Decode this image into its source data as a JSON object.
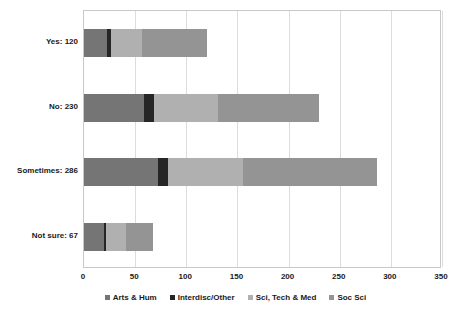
{
  "chart_data": {
    "type": "bar",
    "orientation": "horizontal",
    "stacked": true,
    "title": "",
    "xlabel": "",
    "ylabel": "",
    "xlim": [
      0,
      350
    ],
    "xticks": [
      0,
      50,
      100,
      150,
      200,
      250,
      300,
      350
    ],
    "grid": true,
    "legend_position": "bottom",
    "categories": [
      "Yes: 120",
      "No: 230",
      "Sometimes: 286",
      "Not sure: 67"
    ],
    "category_totals": [
      120,
      230,
      286,
      67
    ],
    "series": [
      {
        "name": "Arts & Hum",
        "color": "#757575",
        "values": [
          22,
          59,
          72,
          20
        ]
      },
      {
        "name": "Interdisc/Other",
        "color": "#262626",
        "values": [
          4,
          9,
          10,
          2
        ]
      },
      {
        "name": "Sci, Tech & Med",
        "color": "#b0b0b0",
        "values": [
          31,
          63,
          73,
          19
        ]
      },
      {
        "name": "Soc Sci",
        "color": "#949494",
        "values": [
          63,
          99,
          131,
          26
        ]
      }
    ]
  },
  "axis": {
    "x_tick_labels": [
      "0",
      "50",
      "100",
      "150",
      "200",
      "250",
      "300",
      "350"
    ],
    "y_tick_labels": [
      "Yes: 120",
      "No: 230",
      "Sometimes: 286",
      "Not sure: 67"
    ]
  },
  "legend": {
    "items": [
      {
        "label": "Arts & Hum",
        "color": "#757575"
      },
      {
        "label": "Interdisc/Other",
        "color": "#262626"
      },
      {
        "label": "Sci, Tech & Med",
        "color": "#b0b0b0"
      },
      {
        "label": "Soc Sci",
        "color": "#949494"
      }
    ]
  },
  "colors": {
    "plot_background": "#ffffff",
    "grid": "#dcdcdc",
    "border": "#c8c8c8",
    "text": "#1a1a1a"
  }
}
